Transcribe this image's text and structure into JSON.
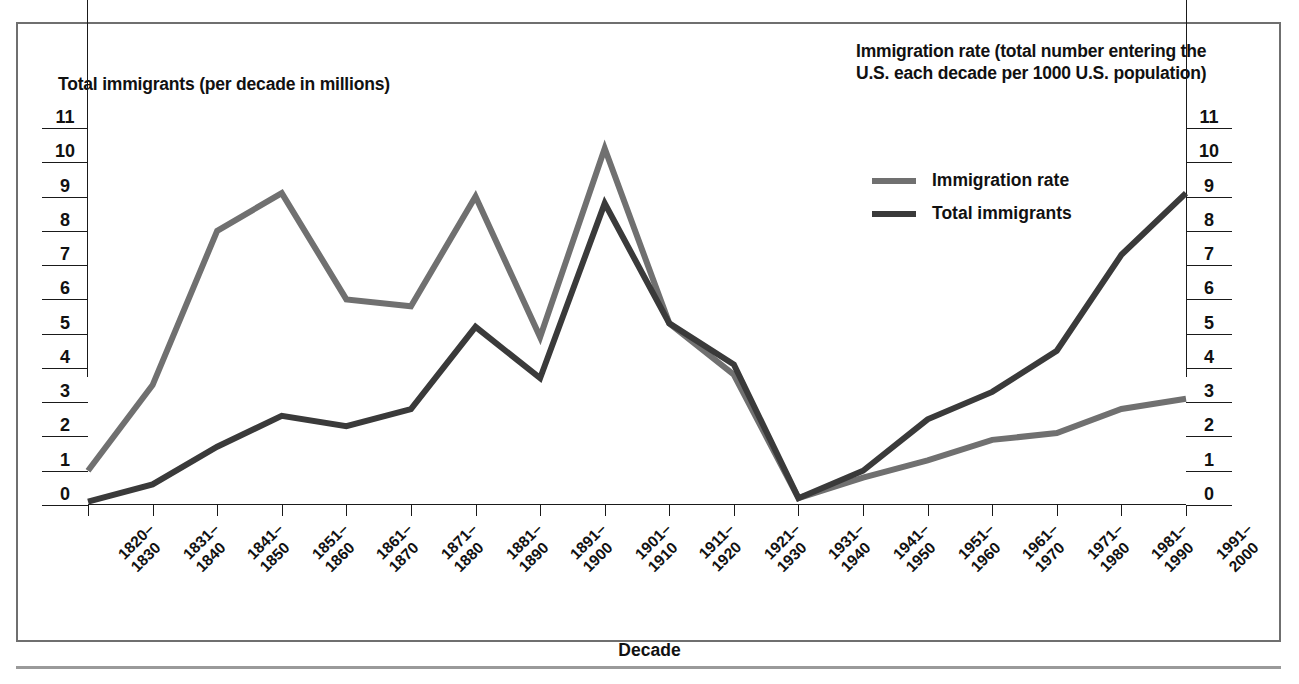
{
  "figure": {
    "left_axis_caption": "Total immigrants (per decade in millions)",
    "right_axis_caption": "Immigration rate (total number entering the\nU.S. each decade per 1000 U.S. population)",
    "x_axis_title": "Decade"
  },
  "legend": {
    "items": [
      {
        "label": "Immigration rate",
        "color": "#707070"
      },
      {
        "label": "Total immigrants",
        "color": "#3a3a3a"
      }
    ]
  },
  "colors": {
    "immigration_rate": "#707070",
    "total_immigrants": "#3a3a3a",
    "axis": "#1a1a1a",
    "frame": "#6f6f6f",
    "background": "#ffffff"
  },
  "axes": {
    "y_ticks": [
      "0",
      "1",
      "2",
      "3",
      "4",
      "5",
      "6",
      "7",
      "8",
      "9",
      "10",
      "11"
    ],
    "y_min": 0,
    "y_max": 11,
    "y_left_title": "Total immigrants (per decade in millions)",
    "y_right_title": "Immigration rate (total number entering the U.S. each decade per 1000 U.S. population)"
  },
  "chart_data": {
    "type": "line",
    "title": "",
    "xlabel": "Decade",
    "ylabel": "Total immigrants (per decade in millions)",
    "y2label": "Immigration rate (total number entering the U.S. each decade per 1000 U.S. population)",
    "ylim": [
      0,
      11
    ],
    "grid": false,
    "legend_position": "upper-right",
    "categories": [
      "1820–\n1830",
      "1831–\n1840",
      "1841–\n1850",
      "1851–\n1860",
      "1861–\n1870",
      "1871–\n1880",
      "1881–\n1890",
      "1891–\n1900",
      "1901–\n1910",
      "1911–\n1920",
      "1921–\n1930",
      "1931–\n1940",
      "1941–\n1950",
      "1951–\n1960",
      "1961–\n1970",
      "1971–\n1980",
      "1981–\n1990",
      "1991–\n2000"
    ],
    "categories_flat": [
      "1820-1830",
      "1831-1840",
      "1841-1850",
      "1851-1860",
      "1861-1870",
      "1871-1880",
      "1881-1890",
      "1891-1900",
      "1901-1910",
      "1911-1920",
      "1921-1930",
      "1931-1940",
      "1941-1950",
      "1951-1960",
      "1961-1970",
      "1971-1980",
      "1981-1990",
      "1991-2000"
    ],
    "series": [
      {
        "name": "Immigration rate",
        "color": "#707070",
        "values": [
          1.0,
          3.5,
          8.0,
          9.1,
          6.0,
          5.8,
          9.0,
          4.9,
          10.4,
          5.3,
          3.8,
          0.2,
          0.8,
          1.3,
          1.9,
          2.1,
          2.8,
          3.1
        ]
      },
      {
        "name": "Total immigrants",
        "color": "#3a3a3a",
        "values": [
          0.1,
          0.6,
          1.7,
          2.6,
          2.3,
          2.8,
          5.2,
          3.7,
          8.8,
          5.3,
          4.1,
          0.2,
          1.0,
          2.5,
          3.3,
          4.5,
          7.3,
          9.1
        ]
      }
    ]
  }
}
